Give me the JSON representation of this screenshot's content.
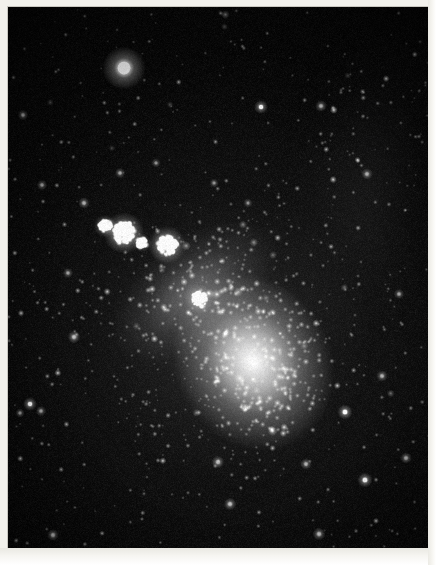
{
  "image": {
    "kind": "astronomical-photograph",
    "subject": "irregular dwarf galaxy resolved into stars",
    "orientation": "portrait",
    "width_px": 436,
    "height_px": 565,
    "border": {
      "style": "printed paper margin",
      "color": "#f2f1ec",
      "left_px": 8,
      "top_px": 7,
      "right_px": 8,
      "bottom_px": 17
    },
    "field": {
      "left_px": 8,
      "top_px": 7,
      "width_px": 420,
      "height_px": 541,
      "background_color": "#050505",
      "sky_noise_color": "#1a1a1a"
    }
  },
  "scene": {
    "galaxy": {
      "name": "resolved irregular galaxy",
      "core": {
        "cx": 245,
        "cy": 355,
        "rx": 78,
        "ry": 92,
        "rotation_deg": -28,
        "peak_brightness": 0.98,
        "color": "#ffffff"
      },
      "bar_extension": {
        "cx": 185,
        "cy": 285,
        "rx": 95,
        "ry": 52,
        "rotation_deg": -38,
        "peak_brightness": 0.42
      },
      "outer_halo": {
        "cx": 215,
        "cy": 330,
        "rx": 150,
        "ry": 160,
        "rotation_deg": -30,
        "peak_brightness": 0.16
      },
      "star_density_core": 0.92,
      "star_density_halo": 0.34
    },
    "background_glow_band": {
      "cx": 360,
      "cy": 170,
      "rx": 90,
      "ry": 180,
      "rotation_deg": 8,
      "peak_brightness": 0.1
    },
    "bright_clusters": [
      {
        "label": "cluster-a",
        "cx": 116,
        "cy": 226,
        "r": 11,
        "brightness": 0.95
      },
      {
        "label": "cluster-b",
        "cx": 159,
        "cy": 238,
        "r": 10,
        "brightness": 0.92
      },
      {
        "label": "cluster-c",
        "cx": 97,
        "cy": 219,
        "r": 6,
        "brightness": 0.72
      },
      {
        "label": "cluster-d",
        "cx": 191,
        "cy": 292,
        "r": 8,
        "brightness": 0.6
      },
      {
        "label": "cluster-e",
        "cx": 134,
        "cy": 236,
        "r": 5,
        "brightness": 0.55
      }
    ],
    "foreground_stars": [
      {
        "label": "bright-star-upper-left",
        "cx": 116,
        "cy": 61,
        "r": 7.5,
        "brightness": 1.0
      },
      {
        "label": "star-2",
        "cx": 253,
        "cy": 100,
        "r": 2.4,
        "brightness": 0.85
      },
      {
        "label": "star-3",
        "cx": 313,
        "cy": 99,
        "r": 2.0,
        "brightness": 0.75
      },
      {
        "label": "star-4",
        "cx": 359,
        "cy": 167,
        "r": 2.0,
        "brightness": 0.72
      },
      {
        "label": "star-5",
        "cx": 76,
        "cy": 196,
        "r": 2.0,
        "brightness": 0.7
      },
      {
        "label": "star-6",
        "cx": 15,
        "cy": 108,
        "r": 1.8,
        "brightness": 0.66
      },
      {
        "label": "star-7",
        "cx": 34,
        "cy": 178,
        "r": 1.8,
        "brightness": 0.64
      },
      {
        "label": "star-8",
        "cx": 66,
        "cy": 330,
        "r": 2.2,
        "brightness": 0.78
      },
      {
        "label": "star-9",
        "cx": 22,
        "cy": 397,
        "r": 2.4,
        "brightness": 0.84
      },
      {
        "label": "star-10",
        "cx": 33,
        "cy": 404,
        "r": 1.8,
        "brightness": 0.66
      },
      {
        "label": "star-11",
        "cx": 12,
        "cy": 406,
        "r": 1.6,
        "brightness": 0.6
      },
      {
        "label": "star-12",
        "cx": 337,
        "cy": 405,
        "r": 2.6,
        "brightness": 0.88
      },
      {
        "label": "star-13",
        "cx": 374,
        "cy": 369,
        "r": 2.0,
        "brightness": 0.72
      },
      {
        "label": "star-14",
        "cx": 357,
        "cy": 473,
        "r": 2.6,
        "brightness": 0.9
      },
      {
        "label": "star-15",
        "cx": 311,
        "cy": 527,
        "r": 2.2,
        "brightness": 0.8
      },
      {
        "label": "star-16",
        "cx": 45,
        "cy": 528,
        "r": 2.0,
        "brightness": 0.74
      },
      {
        "label": "star-17",
        "cx": 210,
        "cy": 455,
        "r": 2.2,
        "brightness": 0.78
      },
      {
        "label": "star-18",
        "cx": 222,
        "cy": 497,
        "r": 2.2,
        "brightness": 0.78
      },
      {
        "label": "star-19",
        "cx": 298,
        "cy": 457,
        "r": 2.0,
        "brightness": 0.72
      },
      {
        "label": "star-20",
        "cx": 112,
        "cy": 166,
        "r": 1.8,
        "brightness": 0.66
      },
      {
        "label": "star-21",
        "cx": 148,
        "cy": 156,
        "r": 1.6,
        "brightness": 0.6
      },
      {
        "label": "star-22",
        "cx": 206,
        "cy": 176,
        "r": 1.6,
        "brightness": 0.6
      },
      {
        "label": "star-23",
        "cx": 391,
        "cy": 287,
        "r": 1.8,
        "brightness": 0.66
      },
      {
        "label": "star-24",
        "cx": 398,
        "cy": 451,
        "r": 2.0,
        "brightness": 0.72
      },
      {
        "label": "star-25",
        "cx": 60,
        "cy": 266,
        "r": 1.8,
        "brightness": 0.64
      },
      {
        "label": "star-26",
        "cx": 240,
        "cy": 196,
        "r": 1.6,
        "brightness": 0.58
      }
    ],
    "render": {
      "total_field_stars": 5200,
      "seed": 20240917,
      "grain_amount": 0.22
    }
  }
}
